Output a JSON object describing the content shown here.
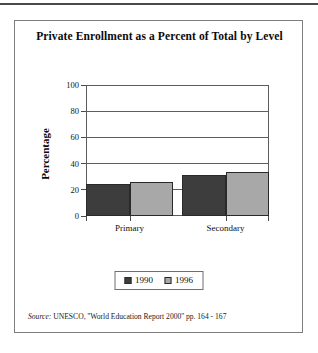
{
  "figure": {
    "title": "Private Enrollment as a Percent of Total by Level",
    "source_lead": "Source:",
    "source_text": "UNESCO, ''World Education Report 2000'' pp. 164 - 167"
  },
  "colors": {
    "series_1990": "#3d3d3d",
    "series_1996": "#a8a8a8",
    "bar_outline": "#2a2a2a",
    "axis": "#5d5d5d",
    "card_border": "#7d7d7d",
    "text": "#0b0b0b",
    "page_background": "#ffffff"
  },
  "chart_data": {
    "type": "bar",
    "title": "Private Enrollment as a Percent of Total by Level",
    "xlabel": "",
    "ylabel": "Percentage",
    "categories": [
      "Primary",
      "Secondary"
    ],
    "series": [
      {
        "name": "1990",
        "values": [
          24.5,
          31.5
        ],
        "color": "#3d3d3d"
      },
      {
        "name": "1996",
        "values": [
          26.0,
          33.5
        ],
        "color": "#a8a8a8"
      }
    ],
    "ylim": [
      0,
      100
    ],
    "yticks": [
      0,
      20,
      40,
      60,
      80,
      100
    ],
    "ytick_labels": [
      "0",
      "20",
      "40",
      "60",
      "80",
      "100"
    ],
    "grid": true,
    "grid_axis": "y",
    "legend_position": "bottom",
    "legend_entries": [
      "1990",
      "1996"
    ]
  }
}
